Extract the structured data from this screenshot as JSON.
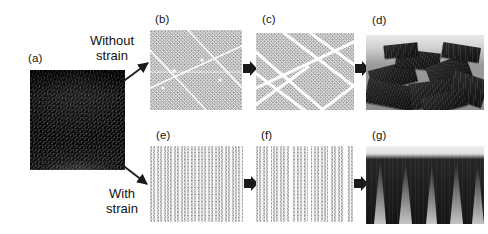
{
  "figure": {
    "type": "process-flow-diagram",
    "background_color": "#ffffff",
    "panels": [
      {
        "id": "a",
        "label": "(a)",
        "kind": "sem-micrograph",
        "content": "as-grown vertically aligned nanotube forest, top-tilted view",
        "x": 30,
        "y": 70,
        "w": 95,
        "h": 100
      },
      {
        "id": "b",
        "label": "(b)",
        "kind": "schematic-lattice",
        "content": "unstrained hexagonal lattice with incipient random shear bands",
        "x": 150,
        "y": 30,
        "w": 92,
        "h": 80
      },
      {
        "id": "c",
        "label": "(c)",
        "kind": "schematic-lattice",
        "content": "lattice fully divided into randomly oriented triangular domains",
        "x": 256,
        "y": 33,
        "w": 98,
        "h": 77
      },
      {
        "id": "d",
        "label": "(d)",
        "kind": "sem-micrograph",
        "content": "collapsed forest forming randomly oriented flakes",
        "x": 366,
        "y": 35,
        "w": 118,
        "h": 75
      },
      {
        "id": "e",
        "label": "(e)",
        "kind": "schematic-lattice",
        "content": "strained lattice showing uniform vertical alignment",
        "x": 150,
        "y": 146,
        "w": 93,
        "h": 76
      },
      {
        "id": "f",
        "label": "(f)",
        "kind": "schematic-lattice",
        "content": "lattice split into parallel vertical stripe domains",
        "x": 256,
        "y": 146,
        "w": 97,
        "h": 76
      },
      {
        "id": "g",
        "label": "(g)",
        "kind": "sem-micrograph",
        "content": "collapsed forest forming aligned parallel ridges",
        "x": 366,
        "y": 146,
        "w": 118,
        "h": 78
      }
    ],
    "flow_labels": [
      {
        "id": "without-strain",
        "line1": "Without",
        "line2": "strain",
        "x": 68,
        "y": 33
      },
      {
        "id": "with-strain",
        "line1": "With",
        "line2": "strain",
        "x": 92,
        "y": 186
      }
    ],
    "arrows": [
      {
        "id": "a-to-b",
        "style": "thin-diagonal",
        "from": "a",
        "to": "b",
        "direction": "up-right"
      },
      {
        "id": "a-to-e",
        "style": "thin-diagonal",
        "from": "a",
        "to": "e",
        "direction": "down-right"
      },
      {
        "id": "b-to-c",
        "style": "block",
        "from": "b",
        "to": "c",
        "direction": "right"
      },
      {
        "id": "c-to-d",
        "style": "block",
        "from": "c",
        "to": "d",
        "direction": "right"
      },
      {
        "id": "e-to-f",
        "style": "block",
        "from": "e",
        "to": "f",
        "direction": "right"
      },
      {
        "id": "f-to-g",
        "style": "block",
        "from": "f",
        "to": "g",
        "direction": "right"
      }
    ],
    "colors": {
      "lattice_dot": "#9a9a9a",
      "crack_line": "#ffffff",
      "arrow": "#1a1a1a",
      "text": "#111111",
      "substrate_light": "#9a9a9a",
      "forest_dark": "#141414"
    }
  }
}
